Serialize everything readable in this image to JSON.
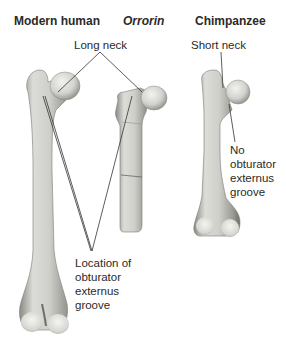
{
  "diagram": {
    "columns": [
      {
        "id": "modern-human",
        "title": "Modern human",
        "italic": false
      },
      {
        "id": "orrorin",
        "title": "Orrorin",
        "italic": true
      },
      {
        "id": "chimpanzee",
        "title": "Chimpanzee",
        "italic": false
      }
    ],
    "labels": {
      "long_neck": "Long neck",
      "short_neck": "Short neck",
      "no_groove": [
        "No",
        "obturator",
        "externus",
        "groove"
      ],
      "location_groove": [
        "Location of",
        "obturator",
        "externus",
        "groove"
      ]
    },
    "colors": {
      "bone_light": "#e9e9e6",
      "bone_mid": "#bdbdb8",
      "bone_dark": "#6f6f6a",
      "leader_line": "#333333"
    }
  }
}
